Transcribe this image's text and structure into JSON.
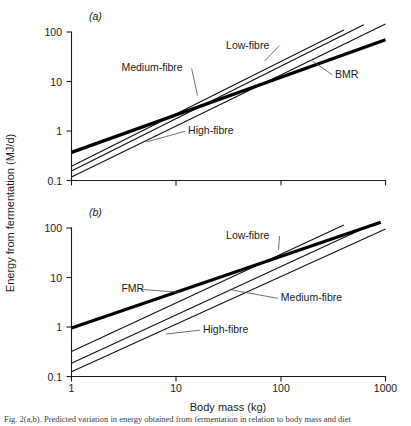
{
  "figure": {
    "axis_titles": {
      "x": "Body mass (kg)",
      "y": "Energy from fermentation (MJ/d)"
    },
    "panel_letters": {
      "a": "(a)",
      "b": "(b)"
    },
    "caption_partial": "Fig. 2(a,b). Predicted variation in energy obtained from fermentation in relation to body mass and diet"
  },
  "chart_data": [
    {
      "id": "panel-a",
      "type": "line",
      "title": "(a)",
      "xlabel": "Body mass (kg)",
      "ylabel": "Energy from fermentation (MJ/d)",
      "xscale": "log",
      "yscale": "log",
      "xlim": [
        1,
        1000
      ],
      "ylim": [
        0.1,
        100
      ],
      "xticks": [
        1,
        10,
        100,
        1000
      ],
      "xtick_labels": [
        "1",
        "10",
        "100",
        "1000"
      ],
      "yticks": [
        0.1,
        1,
        10,
        100
      ],
      "ytick_labels": [
        "0.1",
        "1",
        "10",
        "100"
      ],
      "grid": false,
      "legend": "inline-annotations",
      "series": [
        {
          "name": "BMR",
          "style": "thick",
          "x": [
            1,
            1000
          ],
          "y": [
            0.37,
            70
          ],
          "note": "basal metabolic rate reference line, slope ~0.75"
        },
        {
          "name": "Low-fibre",
          "style": "thin",
          "x": [
            1,
            400
          ],
          "y": [
            0.195,
            110
          ],
          "note": "steepest intercept of the three diet lines"
        },
        {
          "name": "Medium-fibre",
          "style": "thin",
          "x": [
            1,
            620
          ],
          "y": [
            0.155,
            140
          ],
          "note": "middle diet line"
        },
        {
          "name": "High-fibre",
          "style": "thin",
          "x": [
            1,
            1000
          ],
          "y": [
            0.118,
            145
          ],
          "note": "lowest intercept of the three diet lines"
        }
      ],
      "annotations": [
        {
          "text": "Low-fibre",
          "x_text": 30,
          "y_text": 46,
          "points_to_x": 70,
          "points_to_y": 26
        },
        {
          "text": "Medium-fibre",
          "x_text": 3.0,
          "y_text": 16,
          "points_to_x": 16,
          "points_to_y": 5.2
        },
        {
          "text": "High-fibre",
          "x_text": 13,
          "y_text": 0.86,
          "points_to_x": 5.2,
          "points_to_y": 0.6
        },
        {
          "text": "BMR",
          "x_text": 330,
          "y_text": 12,
          "points_to_x": 200,
          "points_to_y": 26
        }
      ]
    },
    {
      "id": "panel-b",
      "type": "line",
      "title": "(b)",
      "xlabel": "Body mass (kg)",
      "ylabel": "Energy from fermentation (MJ/d)",
      "xscale": "log",
      "yscale": "log",
      "xlim": [
        1,
        1000
      ],
      "ylim": [
        0.1,
        100
      ],
      "xticks": [
        1,
        10,
        100,
        1000
      ],
      "xtick_labels": [
        "1",
        "10",
        "100",
        "1000"
      ],
      "yticks": [
        0.1,
        1,
        10,
        100
      ],
      "ytick_labels": [
        "0.1",
        "1",
        "10",
        "100"
      ],
      "grid": false,
      "legend": "inline-annotations",
      "series": [
        {
          "name": "FMR",
          "style": "thick",
          "x": [
            1,
            900
          ],
          "y": [
            0.95,
            130
          ],
          "note": "field metabolic rate reference line, slope ~0.75"
        },
        {
          "name": "Low-fibre",
          "style": "thin",
          "x": [
            1,
            400
          ],
          "y": [
            0.32,
            115
          ],
          "note": "crosses FMR near 60 kg"
        },
        {
          "name": "Medium-fibre",
          "style": "thin",
          "x": [
            1,
            660
          ],
          "y": [
            0.185,
            105
          ],
          "note": "middle diet line"
        },
        {
          "name": "High-fibre",
          "style": "thin",
          "x": [
            1,
            1000
          ],
          "y": [
            0.125,
            95
          ],
          "note": "lowest diet line"
        }
      ],
      "annotations": [
        {
          "text": "Low-fibre",
          "x_text": 30,
          "y_text": 60,
          "points_to_x": 95,
          "points_to_y": 36
        },
        {
          "text": "FMR",
          "x_text": 3.0,
          "y_text": 5.0,
          "points_to_x": 11,
          "points_to_y": 5.0
        },
        {
          "text": "Medium-fibre",
          "x_text": 100,
          "y_text": 3.3,
          "points_to_x": 34,
          "points_to_y": 5.6
        },
        {
          "text": "High-fibre",
          "x_text": 18,
          "y_text": 0.75,
          "points_to_x": 8.0,
          "points_to_y": 0.72
        }
      ]
    }
  ]
}
